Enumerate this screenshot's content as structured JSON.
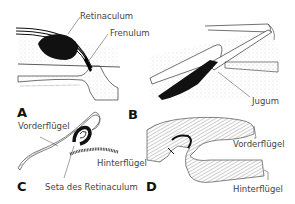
{
  "figure": {
    "panels": [
      {
        "id": "A",
        "letter": "A",
        "labels": [
          "Retinaculum",
          "Frenulum"
        ]
      },
      {
        "id": "B",
        "letter": "B",
        "labels": [
          "Jugum"
        ]
      },
      {
        "id": "C",
        "letter": "C",
        "labels": [
          "Vorderflügel",
          "Hinterflügel",
          "Seta des Retinaculum"
        ]
      },
      {
        "id": "D",
        "letter": "D",
        "labels": [
          "Vorderflügel",
          "Hinterflügel"
        ]
      }
    ]
  },
  "labels": {
    "a_retinaculum": "Retinaculum",
    "a_frenulum": "Frenulum",
    "b_jugum": "Jugum",
    "c_vorderfluegel": "Vorderflügel",
    "c_hinterfluegel": "Hinterflügel",
    "c_seta": "Seta des Retinaculum",
    "d_vorderfluegel": "Vorderflügel",
    "d_hinterfluegel": "Hinterflügel"
  },
  "letters": {
    "a": "A",
    "b": "B",
    "c": "C",
    "d": "D"
  },
  "colors": {
    "ink": "#111111",
    "stipple": "#bbbbbb",
    "text": "#444444",
    "background": "#ffffff"
  }
}
